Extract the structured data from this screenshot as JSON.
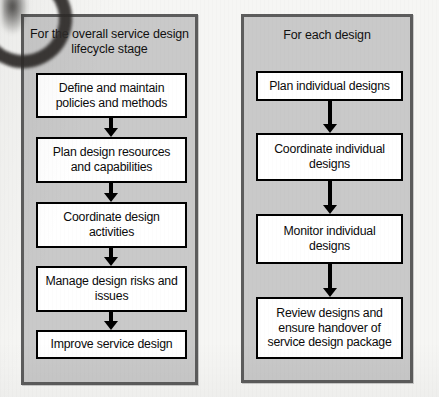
{
  "diagram": {
    "background_color": "#f6f6f4",
    "panel_fill_color": "#c9c9c9",
    "panel_border_color": "#5c5c5c",
    "node_fill_color": "#ffffff",
    "node_border_color": "#000000",
    "arrow_color": "#000000"
  },
  "columns": [
    {
      "id": "overall-lifecycle",
      "header": "For the overall service design lifecycle stage",
      "nodes": [
        {
          "id": "define-maintain-policies",
          "label": "Define and maintain policies and methods"
        },
        {
          "id": "plan-design-resources",
          "label": "Plan design resources and capabilities"
        },
        {
          "id": "coordinate-design-activities",
          "label": "Coordinate design activities"
        },
        {
          "id": "manage-design-risks",
          "label": "Manage design risks and issues"
        },
        {
          "id": "improve-service-design",
          "label": "Improve service design"
        }
      ]
    },
    {
      "id": "each-design",
      "header": "For each design",
      "nodes": [
        {
          "id": "plan-individual-designs",
          "label": "Plan individual designs"
        },
        {
          "id": "coordinate-individual-designs",
          "label": "Coordinate individual designs"
        },
        {
          "id": "monitor-individual-designs",
          "label": "Monitor individual designs"
        },
        {
          "id": "review-designs-handover",
          "label": "Review designs and ensure handover of service design package"
        }
      ]
    }
  ],
  "artifact": {
    "name": "scan-binding-shadow"
  }
}
